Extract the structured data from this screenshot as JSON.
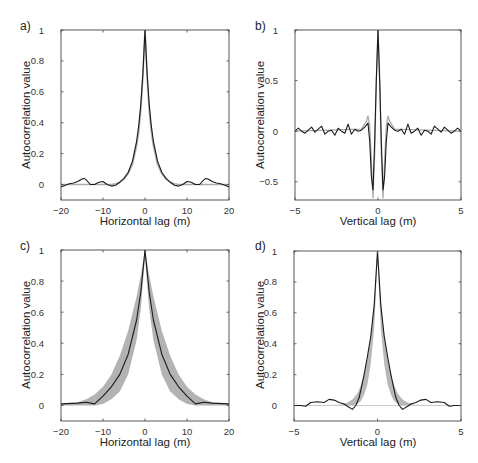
{
  "chart_data": [
    {
      "panel": "a)",
      "type": "line",
      "xlabel": "Horizontal lag (m)",
      "ylabel": "Autocorrelation value",
      "xlim": [
        -20,
        20
      ],
      "ylim": [
        -0.1,
        1
      ],
      "xticks": [
        -20,
        -10,
        0,
        10,
        20
      ],
      "yticks": [
        0,
        0.2,
        0.4,
        0.6,
        0.8,
        1
      ],
      "ytick_labels": [
        "0",
        "0.2",
        "0.4",
        "0.6",
        "0.8",
        "1"
      ],
      "xtick_labels": [
        "−20",
        "−10",
        "0",
        "10",
        "20"
      ],
      "grid": false,
      "box": [
        61,
        30,
        229,
        200
      ],
      "series": [
        {
          "name": "model",
          "color": "#aaaaaa",
          "width": 1.6,
          "x": [
            -20,
            -16,
            -12,
            -10,
            -8,
            -7,
            -6,
            -5,
            -4,
            -3,
            -2,
            -1.5,
            -1,
            -0.5,
            0,
            0.5,
            1,
            1.5,
            2,
            3,
            4,
            5,
            6,
            7,
            8,
            10,
            12,
            16,
            20
          ],
          "y": [
            0,
            0,
            0,
            0,
            0,
            0.005,
            0.015,
            0.035,
            0.07,
            0.13,
            0.25,
            0.34,
            0.48,
            0.7,
            1,
            0.7,
            0.48,
            0.34,
            0.25,
            0.13,
            0.07,
            0.035,
            0.015,
            0.005,
            0,
            0,
            0,
            0,
            0
          ]
        },
        {
          "name": "data",
          "color": "#1a1a1a",
          "width": 1.1,
          "x": [
            -20,
            -19,
            -18,
            -17,
            -16,
            -15,
            -14.5,
            -14,
            -13,
            -12,
            -11,
            -10,
            -9,
            -8,
            -7,
            -6,
            -5,
            -4,
            -3,
            -2,
            -1.5,
            -1,
            -0.5,
            0,
            0.5,
            1,
            1.5,
            2,
            3,
            4,
            5,
            6,
            7,
            8,
            9,
            10,
            11,
            12,
            13,
            14,
            14.5,
            15,
            16,
            17,
            18,
            19,
            20
          ],
          "y": [
            -0.015,
            -0.005,
            0.005,
            0.01,
            0.02,
            0.035,
            0.04,
            0.03,
            0.0,
            0.0,
            0.015,
            0.02,
            0.0,
            -0.01,
            -0.005,
            0.015,
            0.04,
            0.08,
            0.15,
            0.28,
            0.38,
            0.52,
            0.72,
            1,
            0.72,
            0.52,
            0.38,
            0.28,
            0.15,
            0.08,
            0.04,
            0.015,
            -0.005,
            -0.01,
            0.0,
            0.02,
            0.015,
            0.0,
            0.0,
            0.03,
            0.04,
            0.035,
            0.02,
            0.01,
            0.005,
            -0.005,
            -0.015
          ]
        }
      ]
    },
    {
      "panel": "b)",
      "type": "line",
      "xlabel": "Vertical lag (m)",
      "ylabel": "Autocorrelation value",
      "xlim": [
        -5,
        5
      ],
      "ylim": [
        -0.68,
        1
      ],
      "xticks": [
        -5,
        0,
        5
      ],
      "yticks": [
        -0.5,
        0,
        0.5,
        1
      ],
      "ytick_labels": [
        "−0.5",
        "0",
        "0.5",
        "1"
      ],
      "xtick_labels": [
        "−5",
        "0",
        "5"
      ],
      "grid": false,
      "box": [
        295,
        30,
        461,
        200
      ],
      "series": [
        {
          "name": "model",
          "color": "#aaaaaa",
          "width": 1.3,
          "x": [
            -5,
            -1,
            -0.7,
            -0.6,
            -0.5,
            -0.4,
            -0.3,
            -0.2,
            -0.1,
            0,
            0.1,
            0.2,
            0.3,
            0.4,
            0.5,
            0.6,
            0.7,
            1,
            5
          ],
          "y": [
            0,
            0.02,
            0.1,
            0.15,
            0.05,
            -0.3,
            -0.66,
            -0.2,
            0.5,
            1,
            0.5,
            -0.2,
            -0.66,
            -0.3,
            0.05,
            0.15,
            0.1,
            0.02,
            0
          ]
        },
        {
          "name": "data",
          "color": "#1a1a1a",
          "width": 1.1,
          "x": [
            -5,
            -4.8,
            -4.6,
            -4.4,
            -4.2,
            -4.0,
            -3.8,
            -3.6,
            -3.4,
            -3.2,
            -3.0,
            -2.8,
            -2.6,
            -2.4,
            -2.2,
            -2.0,
            -1.8,
            -1.6,
            -1.4,
            -1.2,
            -1.0,
            -0.8,
            -0.6,
            -0.5,
            -0.4,
            -0.3,
            -0.2,
            -0.1,
            0,
            0.1,
            0.2,
            0.3,
            0.4,
            0.5,
            0.6,
            0.8,
            1.0,
            1.2,
            1.4,
            1.6,
            1.8,
            2.0,
            2.2,
            2.4,
            2.6,
            2.8,
            3.0,
            3.2,
            3.4,
            3.6,
            3.8,
            4.0,
            4.2,
            4.4,
            4.6,
            4.8,
            5
          ],
          "y": [
            0,
            0.03,
            0.0,
            -0.02,
            0.01,
            0.04,
            -0.01,
            0.02,
            0.05,
            -0.03,
            0.0,
            0.01,
            -0.04,
            0.03,
            0.0,
            -0.02,
            0.07,
            -0.03,
            0.02,
            0.0,
            0.01,
            0.04,
            0.08,
            -0.1,
            -0.45,
            -0.58,
            -0.1,
            0.5,
            1,
            0.5,
            -0.1,
            -0.58,
            -0.45,
            -0.1,
            0.08,
            0.04,
            0.01,
            0.0,
            0.02,
            -0.03,
            0.07,
            -0.02,
            0.0,
            0.03,
            -0.04,
            0.01,
            0.0,
            -0.03,
            0.05,
            0.02,
            -0.01,
            0.04,
            0.01,
            -0.02,
            0.0,
            0.03,
            0
          ]
        }
      ]
    },
    {
      "panel": "c)",
      "type": "area",
      "xlabel": "Horizontal lag (m)",
      "ylabel": "Autocorrelation value",
      "xlim": [
        -20,
        20
      ],
      "ylim": [
        -0.1,
        1
      ],
      "xticks": [
        -20,
        -10,
        0,
        10,
        20
      ],
      "yticks": [
        0,
        0.2,
        0.4,
        0.6,
        0.8,
        1
      ],
      "ytick_labels": [
        "0",
        "0.2",
        "0.4",
        "0.6",
        "0.8",
        "1"
      ],
      "xtick_labels": [
        "−20",
        "−10",
        "0",
        "10",
        "20"
      ],
      "grid": false,
      "box": [
        61,
        250,
        229,
        421
      ],
      "band": {
        "name": "model envelope",
        "color": "#b3b3b3",
        "x": [
          -20,
          -16,
          -14,
          -12,
          -10,
          -8,
          -6,
          -4,
          -2,
          -1,
          0,
          1,
          2,
          4,
          6,
          8,
          10,
          12,
          14,
          16,
          20
        ],
        "lower": [
          0,
          0,
          0,
          0,
          0.01,
          0.04,
          0.09,
          0.2,
          0.42,
          0.62,
          0.95,
          0.62,
          0.42,
          0.2,
          0.09,
          0.04,
          0.01,
          0,
          0,
          0,
          0
        ],
        "upper": [
          0.01,
          0.02,
          0.04,
          0.07,
          0.12,
          0.2,
          0.32,
          0.48,
          0.7,
          0.84,
          1,
          0.84,
          0.7,
          0.48,
          0.32,
          0.2,
          0.12,
          0.07,
          0.04,
          0.02,
          0.01
        ]
      },
      "series": [
        {
          "name": "mean",
          "color": "#1a1a1a",
          "width": 1.1,
          "x": [
            -20,
            -16,
            -14,
            -12,
            -10,
            -8,
            -6,
            -4,
            -2,
            -1,
            0,
            1,
            2,
            4,
            6,
            8,
            10,
            12,
            14,
            16,
            20
          ],
          "y": [
            0.01,
            0.015,
            0.02,
            0.01,
            0.06,
            0.12,
            0.2,
            0.33,
            0.55,
            0.73,
            1,
            0.73,
            0.55,
            0.33,
            0.2,
            0.12,
            0.06,
            0.01,
            0.02,
            0.015,
            0.01
          ]
        }
      ]
    },
    {
      "panel": "d)",
      "type": "area",
      "xlabel": "Vertical lag (m)",
      "ylabel": "Autocorrelation value",
      "xlim": [
        -5,
        5
      ],
      "ylim": [
        -0.1,
        1
      ],
      "xticks": [
        -5,
        0,
        5
      ],
      "yticks": [
        0,
        0.2,
        0.4,
        0.6,
        0.8,
        1
      ],
      "ytick_labels": [
        "0",
        "0.2",
        "0.4",
        "0.6",
        "0.8",
        "1"
      ],
      "xtick_labels": [
        "−5",
        "0",
        "5"
      ],
      "grid": false,
      "box": [
        294,
        251,
        461,
        421
      ],
      "band": {
        "name": "model envelope",
        "color": "#b8b8b8",
        "x": [
          -5,
          -2.2,
          -1.8,
          -1.5,
          -1.2,
          -1.0,
          -0.8,
          -0.6,
          -0.4,
          -0.2,
          0,
          0.2,
          0.4,
          0.6,
          0.8,
          1.0,
          1.2,
          1.5,
          1.8,
          2.2,
          5
        ],
        "lower": [
          0,
          0,
          0,
          0,
          0.01,
          0.03,
          0.07,
          0.14,
          0.27,
          0.5,
          0.95,
          0.5,
          0.27,
          0.14,
          0.07,
          0.03,
          0.01,
          0,
          0,
          0,
          0
        ],
        "upper": [
          0,
          0.005,
          0.02,
          0.04,
          0.08,
          0.13,
          0.2,
          0.3,
          0.45,
          0.68,
          1,
          0.68,
          0.45,
          0.3,
          0.2,
          0.13,
          0.08,
          0.04,
          0.02,
          0.005,
          0
        ]
      },
      "series": [
        {
          "name": "model",
          "color": "#cccccc",
          "width": 1.0,
          "x": [
            -5,
            5
          ],
          "y": [
            0,
            0
          ]
        },
        {
          "name": "data",
          "color": "#1a1a1a",
          "width": 1.1,
          "x": [
            -5,
            -4.6,
            -4.3,
            -4.0,
            -3.6,
            -3.2,
            -2.9,
            -2.6,
            -2.3,
            -2.0,
            -1.8,
            -1.5,
            -1.3,
            -1.1,
            -1.0,
            -0.8,
            -0.6,
            -0.4,
            -0.2,
            0,
            0.2,
            0.4,
            0.6,
            0.8,
            1.0,
            1.1,
            1.3,
            1.5,
            1.8,
            2.0,
            2.3,
            2.6,
            2.9,
            3.2,
            3.6,
            4.0,
            4.3,
            4.6,
            5
          ],
          "y": [
            0,
            0,
            -0.005,
            0.02,
            0.025,
            0.02,
            0.04,
            0.035,
            0.02,
            0.01,
            -0.005,
            -0.025,
            0.0,
            0.05,
            0.1,
            0.2,
            0.32,
            0.45,
            0.65,
            1,
            0.65,
            0.45,
            0.32,
            0.2,
            0.1,
            0.05,
            0.0,
            -0.025,
            -0.005,
            0.01,
            0.02,
            0.035,
            0.04,
            0.02,
            0.025,
            0.02,
            -0.005,
            0,
            0
          ]
        }
      ]
    }
  ]
}
